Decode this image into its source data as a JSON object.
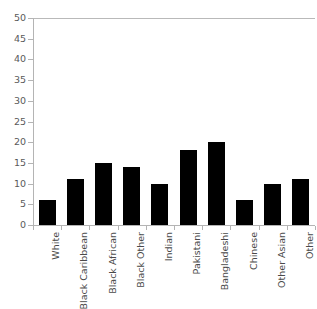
{
  "chart_data": {
    "type": "bar",
    "title": "",
    "subtitle": "",
    "xlabel": "",
    "ylabel": "",
    "categories": [
      "White",
      "Black Caribbean",
      "Black African",
      "Black Other",
      "Indian",
      "Pakistani",
      "Bangladeshi",
      "Chinese",
      "Other Asian",
      "Other"
    ],
    "values": [
      6,
      11,
      15,
      14,
      10,
      18,
      20,
      6,
      10,
      11
    ],
    "ylim": [
      0,
      50
    ],
    "y_ticks": [
      0,
      5,
      10,
      15,
      20,
      25,
      30,
      35,
      40,
      45,
      50
    ],
    "y_tick_labels": [
      "0",
      "5",
      "10",
      "15",
      "20",
      "25",
      "30",
      "35",
      "40",
      "45",
      "50"
    ],
    "grid": false,
    "top_gridline_at": 50,
    "legend": null,
    "legend_position": "none",
    "bar_color": "#000000",
    "axis_color": "#b4b4b4",
    "tick_label_color": "#5a5a5a",
    "category_label_color": "#4a4a4a",
    "background_color": "#ffffff",
    "annotations": []
  }
}
